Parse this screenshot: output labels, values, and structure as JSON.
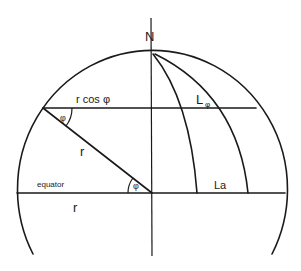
{
  "diagram": {
    "type": "geometry-sphere-latitude",
    "colors": {
      "line": "#1a1a1a",
      "background": "#ffffff"
    },
    "labels": {
      "north": "N",
      "r_cos_phi": "r cos φ",
      "phi_top": "φ",
      "phi_bottom": "φ",
      "r_slant": "r",
      "r_equator": "r",
      "equator": "equator",
      "L_phi_main": "L",
      "L_phi_sub": "φ",
      "L_a": "La"
    }
  }
}
